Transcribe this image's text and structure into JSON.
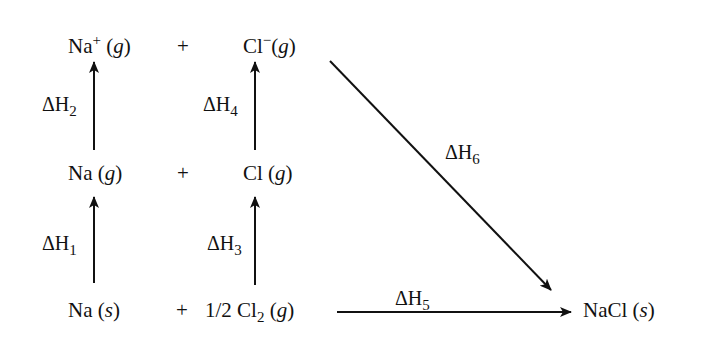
{
  "species": {
    "na_ion_gas": {
      "symbol": "Na",
      "charge": "+",
      "state": "g"
    },
    "cl_ion_gas": {
      "symbol": "Cl",
      "charge": "−",
      "state": "g"
    },
    "na_gas": {
      "symbol": "Na",
      "state": "g"
    },
    "cl_gas": {
      "symbol": "Cl",
      "state": "g"
    },
    "na_solid": {
      "symbol": "Na",
      "state": "s"
    },
    "cl2_gas": {
      "coefficient": "1/2",
      "symbol": "Cl",
      "subscript": "2",
      "state": "g"
    },
    "nacl_solid": {
      "symbol": "NaCl",
      "state": "s"
    }
  },
  "plus_sign": "+",
  "enthalpy_labels": {
    "dh1": {
      "delta": "ΔH",
      "index": "1"
    },
    "dh2": {
      "delta": "ΔH",
      "index": "2"
    },
    "dh3": {
      "delta": "ΔH",
      "index": "3"
    },
    "dh4": {
      "delta": "ΔH",
      "index": "4"
    },
    "dh5": {
      "delta": "ΔH",
      "index": "5"
    },
    "dh6": {
      "delta": "ΔH",
      "index": "6"
    }
  },
  "arrows": [
    {
      "from": "Na (s)",
      "to": "Na (g)",
      "label": "ΔH1"
    },
    {
      "from": "Na (g)",
      "to": "Na+ (g)",
      "label": "ΔH2"
    },
    {
      "from": "1/2 Cl2 (g)",
      "to": "Cl (g)",
      "label": "ΔH3"
    },
    {
      "from": "Cl (g)",
      "to": "Cl− (g)",
      "label": "ΔH4"
    },
    {
      "from": "Na (s) + 1/2 Cl2 (g)",
      "to": "NaCl (s)",
      "label": "ΔH5"
    },
    {
      "from": "Na+ (g) + Cl− (g)",
      "to": "NaCl (s)",
      "label": "ΔH6"
    }
  ]
}
